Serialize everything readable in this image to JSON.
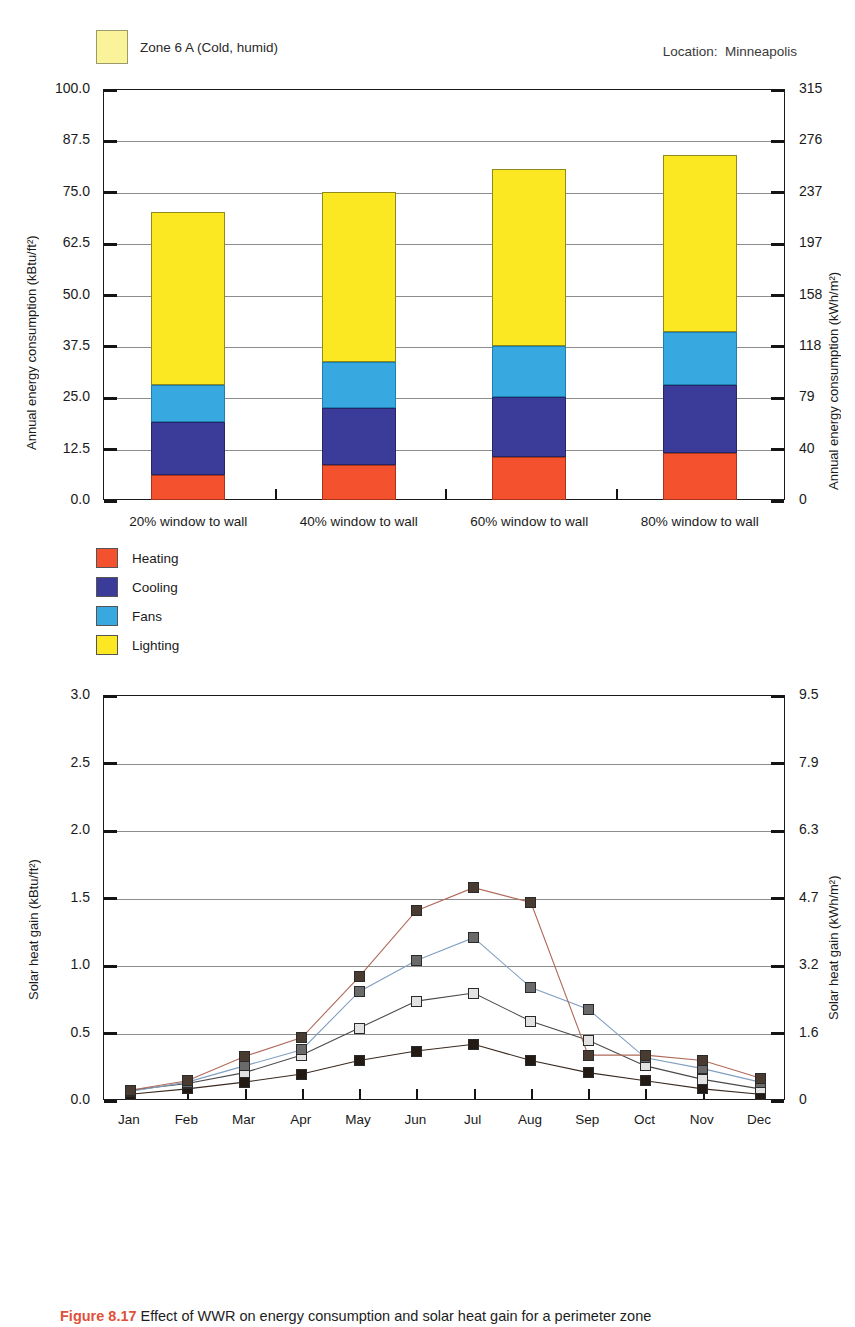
{
  "zone": {
    "label": "Zone 6 A (Cold, humid)",
    "swatch_color": "#fbf39a"
  },
  "location": {
    "text": "Location:  Minneapolis"
  },
  "caption": {
    "figure_number": "Figure 8.17",
    "text": "Effect of WWR on energy consumption and solar heat gain for a perimeter zone"
  },
  "top_chart": {
    "axis_left_title": "Annual energy consumption (kBtu/ft²)",
    "axis_right_title": "Annual energy consumption (kWh/m²)",
    "left_ticks": [
      "100.0",
      "87.5",
      "75.0",
      "62.5",
      "50.0",
      "37.5",
      "25.0",
      "12.5",
      "0.0"
    ],
    "right_ticks": [
      "315",
      "276",
      "237",
      "197",
      "158",
      "118",
      "79",
      "40",
      "0"
    ],
    "categories": [
      "20% window to wall",
      "40% window to wall",
      "60% window to wall",
      "80% window to wall"
    ],
    "legend": [
      {
        "label": "Heating",
        "color": "#f4512f"
      },
      {
        "label": "Cooling",
        "color": "#3b3b99"
      },
      {
        "label": "Fans",
        "color": "#37a8e0"
      },
      {
        "label": "Lighting",
        "color": "#fbe822"
      }
    ]
  },
  "bottom_chart": {
    "axis_left_title": "Solar heat gain (kBtu/ft²)",
    "axis_right_title": "Solar heat gain (kWh/m²)",
    "left_ticks": [
      "3.0",
      "2.5",
      "2.0",
      "1.5",
      "1.0",
      "0.5",
      "0.0"
    ],
    "right_ticks": [
      "9.5",
      "7.9",
      "6.3",
      "4.7",
      "3.2",
      "1.6",
      "0"
    ],
    "months": [
      "Jan",
      "Feb",
      "Mar",
      "Apr",
      "May",
      "Jun",
      "Jul",
      "Aug",
      "Sep",
      "Oct",
      "Nov",
      "Dec"
    ],
    "legend": [
      {
        "label": "Solar heat gain (20% window to wall)",
        "color": "#241a14"
      },
      {
        "label": "Solar heat gain (40% window to wall)",
        "color": "#e2e2e2"
      },
      {
        "label": "Solar heat gain (60% window to wall)",
        "color": "#6a6a6a"
      },
      {
        "label": "Solar heat gain (80% window to wall)",
        "color": "#4a3b30"
      }
    ]
  },
  "chart_data": [
    {
      "type": "bar",
      "title": "Annual energy consumption by window-to-wall ratio",
      "subtitle": "Zone 6 A (Cold, humid) — Location: Minneapolis",
      "stacked": true,
      "xlabel": "",
      "ylabel": "Annual energy consumption (kBtu/ft²)",
      "ylabel_right": "Annual energy consumption (kWh/m²)",
      "ylim": [
        0,
        100
      ],
      "ylim_right": [
        0,
        315
      ],
      "yticks": [
        0.0,
        12.5,
        25.0,
        37.5,
        50.0,
        62.5,
        75.0,
        87.5,
        100.0
      ],
      "yticks_right": [
        0,
        40,
        79,
        118,
        158,
        197,
        237,
        276,
        315
      ],
      "grid": true,
      "legend_position": "below-left",
      "categories": [
        "20% window to wall",
        "40% window to wall",
        "60% window to wall",
        "80% window to wall"
      ],
      "series": [
        {
          "name": "Heating",
          "color": "#f4512f",
          "values": [
            6.0,
            8.5,
            10.5,
            11.5
          ]
        },
        {
          "name": "Cooling",
          "color": "#3b3b99",
          "values": [
            13.0,
            14.0,
            14.5,
            16.5
          ]
        },
        {
          "name": "Fans",
          "color": "#37a8e0",
          "values": [
            9.0,
            11.0,
            12.5,
            13.0
          ]
        },
        {
          "name": "Lighting",
          "color": "#fbe822",
          "values": [
            42.0,
            41.5,
            43.0,
            43.0
          ]
        }
      ],
      "totals": [
        70.0,
        75.0,
        80.5,
        84.0
      ]
    },
    {
      "type": "line",
      "title": "Monthly solar heat gain by window-to-wall ratio",
      "xlabel": "",
      "ylabel": "Solar heat gain (kBtu/ft²)",
      "ylabel_right": "Solar heat gain (kWh/m²)",
      "ylim": [
        0,
        3.0
      ],
      "ylim_right": [
        0,
        9.5
      ],
      "yticks": [
        0.0,
        0.5,
        1.0,
        1.5,
        2.0,
        2.5,
        3.0
      ],
      "yticks_right": [
        0,
        1.6,
        3.2,
        4.7,
        6.3,
        7.9,
        9.5
      ],
      "grid": true,
      "legend_position": "below-left",
      "x": [
        "Jan",
        "Feb",
        "Mar",
        "Apr",
        "May",
        "Jun",
        "Jul",
        "Aug",
        "Sep",
        "Oct",
        "Nov",
        "Dec"
      ],
      "series": [
        {
          "name": "Solar heat gain (20% window to wall)",
          "color": "#241a14",
          "values": [
            0.05,
            0.09,
            0.14,
            0.2,
            0.3,
            0.37,
            0.42,
            0.3,
            0.21,
            0.15,
            0.09,
            0.05
          ]
        },
        {
          "name": "Solar heat gain (40% window to wall)",
          "color": "#e2e2e2",
          "values": [
            0.08,
            0.13,
            0.21,
            0.34,
            0.54,
            0.74,
            0.8,
            0.59,
            0.45,
            0.26,
            0.16,
            0.09
          ]
        },
        {
          "name": "Solar heat gain (60% window to wall)",
          "color": "#6a6a6a",
          "values": [
            0.07,
            0.14,
            0.26,
            0.38,
            0.81,
            1.04,
            1.21,
            0.84,
            0.68,
            0.32,
            0.24,
            0.14
          ]
        },
        {
          "name": "Solar heat gain (80% window to wall)",
          "color": "#4a3b30",
          "values": [
            0.08,
            0.15,
            0.33,
            0.47,
            0.92,
            1.41,
            1.58,
            1.47,
            0.34,
            0.34,
            0.3,
            0.17
          ]
        }
      ]
    }
  ]
}
